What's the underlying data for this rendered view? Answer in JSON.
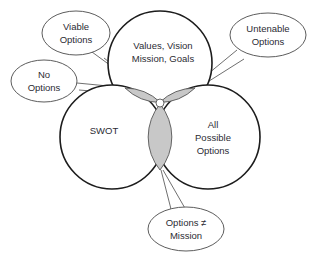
{
  "diagram": {
    "type": "venn-three-circle",
    "background_color": "#ffffff",
    "outline_color": "#1c1c1c",
    "overlap_fill_color": "#c8c8c8",
    "overlap_stroke_color": "#555555",
    "text_color": "#2b2b33",
    "callout_stroke_color": "#4a4a4a",
    "circles": [
      {
        "id": "top",
        "label_line_1": "Values, Vision",
        "label_line_2": "Mission, Goals"
      },
      {
        "id": "bottom-left",
        "label_line_1": "SWOT"
      },
      {
        "id": "bottom-right",
        "label_line_1": "All",
        "label_line_2": "Possible",
        "label_line_3": "Options"
      }
    ],
    "overlaps": [
      {
        "id": "left-lens",
        "between": "Values/Vision + SWOT",
        "fill": "#c8c8c8"
      },
      {
        "id": "right-lens",
        "between": "Values/Vision + All Possible Options",
        "fill": "#c8c8c8"
      },
      {
        "id": "bottom-lens",
        "between": "SWOT + All Possible Options",
        "fill": "#c8c8c8"
      }
    ],
    "center_intersection": {
      "id": "center-dot",
      "fill": "#ffffff"
    },
    "callouts": [
      {
        "id": "viable-options",
        "line_1": "Viable",
        "line_2": "Options",
        "points_to": "center-intersection"
      },
      {
        "id": "untenable-options",
        "line_1": "Untenable",
        "line_2": "Options",
        "points_to": "right-lens"
      },
      {
        "id": "no-options",
        "line_1": "No",
        "line_2": "Options",
        "points_to": "left-lens"
      },
      {
        "id": "options-not-mission",
        "line_1": "Options ≠",
        "line_2": "Mission",
        "points_to": "bottom-lens"
      }
    ]
  }
}
